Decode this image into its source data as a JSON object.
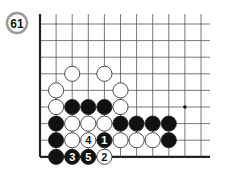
{
  "problem": {
    "number": "61"
  },
  "board": {
    "columns": 11,
    "rows": 9,
    "open_right": true,
    "open_top": true,
    "star_points": [
      [
        9,
        5
      ]
    ],
    "stones": [
      {
        "col": 2,
        "row": 3,
        "color": "white",
        "label": ""
      },
      {
        "col": 4,
        "row": 3,
        "color": "white",
        "label": ""
      },
      {
        "col": 1,
        "row": 4,
        "color": "white",
        "label": ""
      },
      {
        "col": 5,
        "row": 4,
        "color": "white",
        "label": ""
      },
      {
        "col": 1,
        "row": 5,
        "color": "white",
        "label": ""
      },
      {
        "col": 2,
        "row": 5,
        "color": "black",
        "label": ""
      },
      {
        "col": 3,
        "row": 5,
        "color": "black",
        "label": ""
      },
      {
        "col": 4,
        "row": 5,
        "color": "black",
        "label": ""
      },
      {
        "col": 5,
        "row": 5,
        "color": "white",
        "label": ""
      },
      {
        "col": 1,
        "row": 6,
        "color": "black",
        "label": ""
      },
      {
        "col": 2,
        "row": 6,
        "color": "white",
        "label": ""
      },
      {
        "col": 3,
        "row": 6,
        "color": "white",
        "label": ""
      },
      {
        "col": 4,
        "row": 6,
        "color": "white",
        "label": ""
      },
      {
        "col": 5,
        "row": 6,
        "color": "black",
        "label": ""
      },
      {
        "col": 6,
        "row": 6,
        "color": "black",
        "label": ""
      },
      {
        "col": 7,
        "row": 6,
        "color": "black",
        "label": ""
      },
      {
        "col": 8,
        "row": 6,
        "color": "black",
        "label": ""
      },
      {
        "col": 1,
        "row": 7,
        "color": "black",
        "label": ""
      },
      {
        "col": 2,
        "row": 7,
        "color": "white",
        "label": ""
      },
      {
        "col": 3,
        "row": 7,
        "color": "white",
        "label": "4"
      },
      {
        "col": 4,
        "row": 7,
        "color": "black",
        "label": "1"
      },
      {
        "col": 5,
        "row": 7,
        "color": "white",
        "label": ""
      },
      {
        "col": 6,
        "row": 7,
        "color": "white",
        "label": ""
      },
      {
        "col": 7,
        "row": 7,
        "color": "white",
        "label": ""
      },
      {
        "col": 8,
        "row": 7,
        "color": "black",
        "label": ""
      },
      {
        "col": 1,
        "row": 8,
        "color": "black",
        "label": ""
      },
      {
        "col": 2,
        "row": 8,
        "color": "black",
        "label": "3"
      },
      {
        "col": 3,
        "row": 8,
        "color": "black",
        "label": "5"
      },
      {
        "col": 4,
        "row": 8,
        "color": "white",
        "label": "2"
      }
    ]
  },
  "colors": {
    "black_stone": "#111111",
    "white_stone": "#ffffff",
    "grid_line": "#555555",
    "border_line": "#222222",
    "badge_ring": "#9a9a9a"
  }
}
